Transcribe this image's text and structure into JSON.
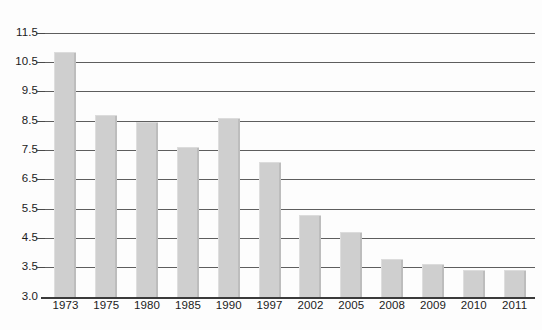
{
  "chart_data": {
    "type": "bar",
    "title": "",
    "subtitle": "",
    "xlabel": "",
    "ylabel": "",
    "categories": [
      "1973",
      "1975",
      "1980",
      "1985",
      "1990",
      "1997",
      "2002",
      "2005",
      "2008",
      "2009",
      "2010",
      "2011"
    ],
    "values": [
      10.85,
      8.7,
      8.45,
      7.6,
      8.6,
      7.1,
      5.3,
      4.7,
      3.8,
      3.6,
      3.45,
      3.45
    ],
    "series": [
      {
        "name": "",
        "values": [
          10.85,
          8.7,
          8.45,
          7.6,
          8.6,
          7.1,
          5.3,
          4.7,
          3.8,
          3.6,
          3.45,
          3.45
        ]
      }
    ],
    "ylim": [
      3.0,
      11.5
    ],
    "ytick_labels": [
      "11.5",
      "10.5",
      "9.5",
      "8.5",
      "7.5",
      "6.5",
      "5.5",
      "4.5",
      "3.5",
      "3.0"
    ],
    "ytick_values": [
      11.5,
      10.5,
      9.5,
      8.5,
      7.5,
      6.5,
      5.5,
      4.5,
      3.5,
      3.0
    ],
    "grid": true,
    "grid_axis": "y",
    "legend": false,
    "legend_position": "none",
    "bar_color": "#cfcfcf",
    "grid_color": "#5e5e5e",
    "axis_color": "#3a3a3a",
    "text_color": "#1b1b1b",
    "background": "#fdfdfd",
    "annotations": []
  }
}
